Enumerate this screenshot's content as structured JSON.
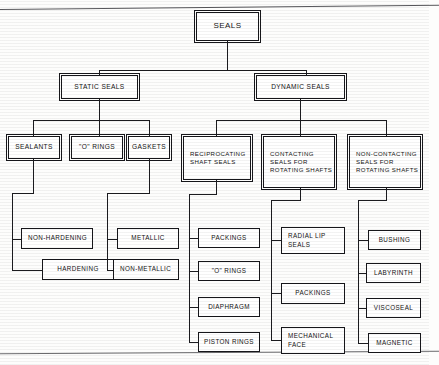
{
  "diagram": {
    "title": "SEALS",
    "type": "hierarchical-tree",
    "root": {
      "label": "SEALS"
    },
    "level2": [
      {
        "id": "static",
        "label": "STATIC  SEALS"
      },
      {
        "id": "dynamic",
        "label": "DYNAMIC SEALS"
      }
    ],
    "level3": [
      {
        "id": "sealants",
        "parent": "static",
        "lines": [
          "SEALANTS"
        ]
      },
      {
        "id": "orings",
        "parent": "static",
        "lines": [
          "\"O\"  RINGS"
        ]
      },
      {
        "id": "gaskets",
        "parent": "static",
        "lines": [
          "GASKETS"
        ]
      },
      {
        "id": "reciprocating",
        "parent": "dynamic",
        "lines": [
          "RECIPROCATING",
          "SHAFT SEALS"
        ]
      },
      {
        "id": "contacting",
        "parent": "dynamic",
        "lines": [
          "CONTACTING",
          "SEALS FOR",
          "ROTATING SHAFTS"
        ]
      },
      {
        "id": "noncontacting",
        "parent": "dynamic",
        "lines": [
          "NON-CONTACTING",
          "SEALS FOR",
          "ROTATING SHAFTS"
        ]
      }
    ],
    "leaves": [
      {
        "id": "non-hardening",
        "parent": "sealants",
        "lines": [
          "NON-HARDENING"
        ]
      },
      {
        "id": "hardening",
        "parent": "sealants",
        "lines": [
          "HARDENING"
        ]
      },
      {
        "id": "metallic",
        "parent": "gaskets",
        "lines": [
          "METALLIC"
        ]
      },
      {
        "id": "non-metallic",
        "parent": "gaskets",
        "lines": [
          "NON-METALLIC"
        ]
      },
      {
        "id": "packings-r",
        "parent": "reciprocating",
        "lines": [
          "PACKINGS"
        ]
      },
      {
        "id": "orings-r",
        "parent": "reciprocating",
        "lines": [
          "\"O\"  RINGS"
        ]
      },
      {
        "id": "diaphragm",
        "parent": "reciprocating",
        "lines": [
          "DIAPHRAGM"
        ]
      },
      {
        "id": "piston-rings",
        "parent": "reciprocating",
        "lines": [
          "PISTON RINGS"
        ]
      },
      {
        "id": "radial-lip",
        "parent": "contacting",
        "lines": [
          "RADIAL LIP",
          "SEALS"
        ]
      },
      {
        "id": "packings-c",
        "parent": "contacting",
        "lines": [
          "PACKINGS"
        ]
      },
      {
        "id": "mechanical",
        "parent": "contacting",
        "lines": [
          "MECHANICAL",
          "FACE"
        ]
      },
      {
        "id": "bushing",
        "parent": "noncontacting",
        "lines": [
          "BUSHING"
        ]
      },
      {
        "id": "labyrinth",
        "parent": "noncontacting",
        "lines": [
          "LABYRINTH"
        ]
      },
      {
        "id": "viscoseal",
        "parent": "noncontacting",
        "lines": [
          "VISCOSEAL"
        ]
      },
      {
        "id": "magnetic",
        "parent": "noncontacting",
        "lines": [
          "MAGNETIC"
        ]
      }
    ]
  }
}
